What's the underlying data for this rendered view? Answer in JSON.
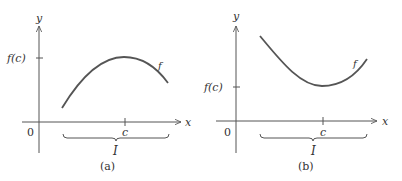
{
  "figure": {
    "panels": [
      {
        "id": "a",
        "caption": "(a)",
        "y_axis_label": "y",
        "x_axis_label": "x",
        "origin_label": "0",
        "fc_label": "f(c)",
        "c_label": "c",
        "interval_label": "I",
        "curve_label": "f",
        "description": "concave-down curve with a local maximum at c"
      },
      {
        "id": "b",
        "caption": "(b)",
        "y_axis_label": "y",
        "x_axis_label": "x",
        "origin_label": "0",
        "fc_label": "f(c)",
        "c_label": "c",
        "interval_label": "I",
        "curve_label": "f",
        "description": "concave-up curve with a local minimum at c"
      }
    ],
    "colors": {
      "axis": "#555555",
      "curve": "#555555",
      "text": "#333333"
    }
  }
}
